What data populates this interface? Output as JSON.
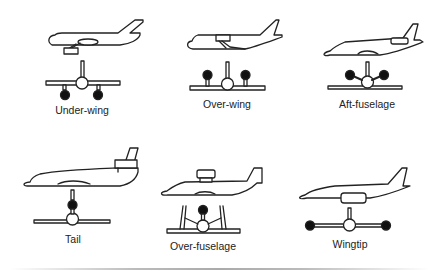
{
  "configurations": [
    {
      "id": "under-wing",
      "label": "Under-wing"
    },
    {
      "id": "over-wing",
      "label": "Over-wing"
    },
    {
      "id": "aft-fuselage",
      "label": "Aft-fuselage"
    },
    {
      "id": "tail",
      "label": "Tail"
    },
    {
      "id": "over-fuselage",
      "label": "Over-fuselage"
    },
    {
      "id": "wingtip",
      "label": "Wingtip"
    }
  ],
  "colors": {
    "line": "#222222",
    "engine_fill": "#111111",
    "background": "#ffffff"
  }
}
